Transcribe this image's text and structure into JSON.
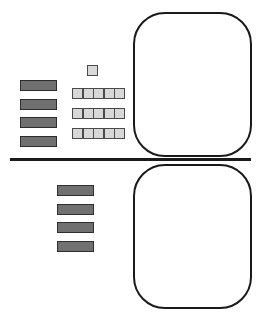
{
  "diagram": {
    "type": "base-ten-blocks",
    "colors": {
      "rod_fill": "#707070",
      "rod_border": "#2e2e2e",
      "unit_fill": "#d8d8d8",
      "unit_border": "#4a4a4a",
      "mat_border": "#1a1a1a",
      "divider": "#1a1a1a"
    },
    "top_section": {
      "tens_rods": 4,
      "unit_cubes_single": 1,
      "unit_cube_rows": [
        5,
        5,
        5
      ],
      "unit_cubes_total": 16,
      "mat": "empty"
    },
    "bottom_section": {
      "tens_rods": 4,
      "unit_cubes_total": 0,
      "mat": "empty"
    }
  }
}
